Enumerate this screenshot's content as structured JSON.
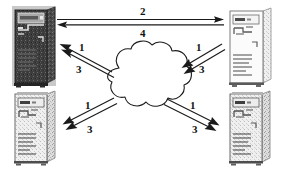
{
  "diagram": {
    "background_color": "#ffffff",
    "line_color": "#1a1a1a",
    "cloud": {
      "name": "network-cloud",
      "fill": "#ffffff",
      "stroke": "#1a1a1a"
    },
    "nodes": [
      {
        "id": "top-left",
        "name": "computer-tower-top-left",
        "style": "dark",
        "body_color": "#4a4a4a",
        "face_color": "#3b3b3b",
        "screen_color": "#8d8d8d"
      },
      {
        "id": "top-right",
        "name": "computer-tower-top-right",
        "style": "light",
        "body_color": "#f2f2f2",
        "face_color": "#e6e6e6",
        "screen_color": "#fafafa"
      },
      {
        "id": "bottom-left",
        "name": "computer-tower-bottom-left",
        "style": "light",
        "body_color": "#dcdcdc",
        "face_color": "#cfcfcf",
        "screen_color": "#efefef"
      },
      {
        "id": "bottom-right",
        "name": "computer-tower-bottom-right",
        "style": "light",
        "body_color": "#dcdcdc",
        "face_color": "#cfcfcf",
        "screen_color": "#efefef"
      }
    ],
    "labels": {
      "top_outbound": "2",
      "top_return": "4",
      "tl_upper": "1",
      "tl_lower": "3",
      "tr_upper": "1",
      "tr_lower": "3",
      "bl_upper": "1",
      "bl_lower": "3",
      "br_upper": "1",
      "br_lower": "3"
    }
  }
}
